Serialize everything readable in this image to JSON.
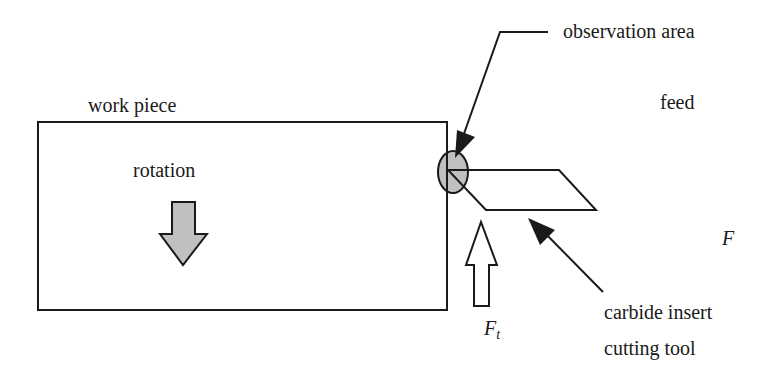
{
  "diagram": {
    "type": "machining-setup-schematic",
    "labels": {
      "observation_area": "observation area",
      "feed": "feed",
      "work_piece": "work piece",
      "rotation": "rotation",
      "force_F": "F",
      "force_Ft_main": "F",
      "force_Ft_sub": "t",
      "tool_line1": "carbide insert",
      "tool_line2": "cutting tool"
    },
    "colors": {
      "stroke": "#1a1a1a",
      "fill_gray": "#c0c0c0",
      "background": "#ffffff"
    },
    "elements": [
      {
        "name": "work-piece",
        "shape": "rectangle"
      },
      {
        "name": "rotation-arrow",
        "shape": "down-arrow",
        "fill": "gray"
      },
      {
        "name": "observation-area",
        "shape": "ellipse",
        "fill": "gray"
      },
      {
        "name": "cutting-tool",
        "shape": "parallelogram"
      },
      {
        "name": "thrust-force-arrow",
        "shape": "up-arrow",
        "fill": "white"
      }
    ]
  }
}
